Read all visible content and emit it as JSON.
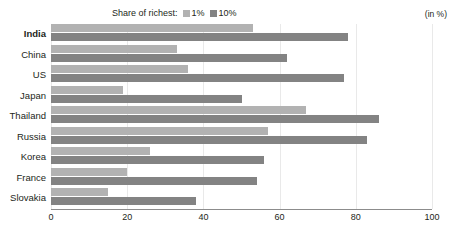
{
  "legend": {
    "title": "Share of richest:",
    "items": [
      {
        "label": "1%",
        "color": "#b2b2b2",
        "key": "s1"
      },
      {
        "label": "10%",
        "color": "#838383",
        "key": "s10"
      }
    ]
  },
  "unit_note": "(in %)",
  "colors": {
    "series_1_percent": "#b2b2b2",
    "series_10_percent": "#838383",
    "axis": "#8c8c8c",
    "gridline": "#e9e9e9",
    "text": "#231f20",
    "background": "#ffffff"
  },
  "highlight_category": "India",
  "chart_data": {
    "type": "bar",
    "orientation": "horizontal",
    "title": "",
    "subtitle": "",
    "xlabel": "",
    "ylabel": "",
    "unit": "(in %)",
    "xlim": [
      0,
      100
    ],
    "xticks": [
      0,
      20,
      40,
      60,
      80,
      100
    ],
    "grid": true,
    "legend_position": "top-center",
    "categories": [
      "India",
      "China",
      "US",
      "Japan",
      "Thailand",
      "Russia",
      "Korea",
      "France",
      "Slovakia"
    ],
    "series": [
      {
        "name": "1%",
        "color": "#b2b2b2",
        "values": [
          53,
          33,
          36,
          19,
          67,
          57,
          26,
          20,
          15
        ]
      },
      {
        "name": "10%",
        "color": "#838383",
        "values": [
          78,
          62,
          77,
          50,
          86,
          83,
          56,
          54,
          38
        ]
      }
    ]
  }
}
